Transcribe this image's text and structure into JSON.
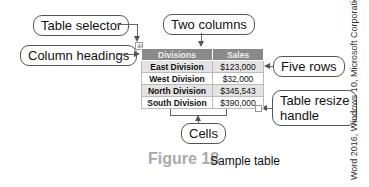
{
  "callouts": {
    "table_selector": "Table selector",
    "column_headings": "Column headings",
    "two_columns": "Two columns",
    "five_rows": "Five rows",
    "table_resize_handle_1": "Table resize",
    "table_resize_handle_2": "handle",
    "cells": "Cells"
  },
  "table": {
    "headers": [
      "Divisions",
      "Sales"
    ],
    "rows": [
      {
        "division": "East Division",
        "sales": "$123,000"
      },
      {
        "division": "West Division",
        "sales": "$32,000"
      },
      {
        "division": "North Division",
        "sales": "$345,543"
      },
      {
        "division": "South Division",
        "sales": "$390,000"
      }
    ],
    "selector_glyph": "⊕"
  },
  "figure": {
    "number": "Figure 18",
    "caption": "Sample table"
  },
  "credit": "Word 2016, Windows 10, Microsoft Corporation"
}
